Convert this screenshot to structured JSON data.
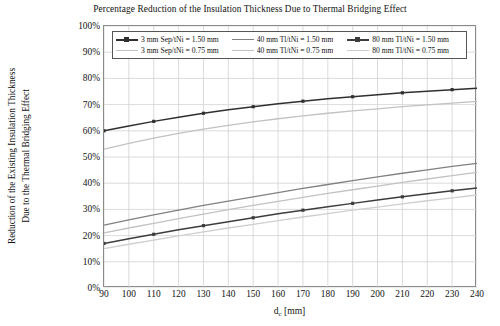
{
  "chart_data": {
    "type": "line",
    "title": "Percentage Reduction of the Insulation Thickness Due to Thermal Bridging Effect",
    "xlabel": "d_c [mm]",
    "xlabel_base": "d",
    "xlabel_sub": "c",
    "xlabel_unit": "[mm]",
    "ylabel_line1": "Reduction of the Existing Insulation Thickness",
    "ylabel_line2": "Due to the Thermal Bridging Effect",
    "xlim": [
      90,
      240
    ],
    "ylim": [
      0,
      100
    ],
    "grid": true,
    "legend_position": "top-inside",
    "x": [
      90,
      100,
      110,
      120,
      130,
      140,
      150,
      160,
      170,
      180,
      190,
      200,
      210,
      220,
      230,
      240
    ],
    "xticklabels": [
      "90",
      "100",
      "110",
      "120",
      "130",
      "140",
      "150",
      "160",
      "170",
      "180",
      "190",
      "200",
      "210",
      "220",
      "230",
      "240"
    ],
    "yticklabels": [
      "0%",
      "10%",
      "20%",
      "30%",
      "40%",
      "50%",
      "60%",
      "70%",
      "80%",
      "90%",
      "100%"
    ],
    "yticks": [
      0,
      10,
      20,
      30,
      40,
      50,
      60,
      70,
      80,
      90,
      100
    ],
    "series": [
      {
        "name": "3 mm Sep/tNi = 1.50 mm",
        "color": "#2f2f2f",
        "width": 1.5,
        "marker": "square",
        "values": [
          60.0,
          61.8,
          63.6,
          65.2,
          66.7,
          68.0,
          69.2,
          70.3,
          71.3,
          72.2,
          73.0,
          73.8,
          74.5,
          75.1,
          75.7,
          76.2
        ]
      },
      {
        "name": "3 mm Sep/tNi = 0.75 mm",
        "color": "#c2c2c2",
        "width": 1.3,
        "marker": "none",
        "values": [
          53.0,
          55.2,
          57.2,
          59.0,
          60.6,
          62.1,
          63.4,
          64.6,
          65.7,
          66.7,
          67.6,
          68.4,
          69.2,
          69.9,
          70.6,
          71.2
        ]
      },
      {
        "name": "40 mm Tl/tNi = 1.50 mm",
        "color": "#808080",
        "width": 1.3,
        "marker": "none",
        "values": [
          24.0,
          26.0,
          27.9,
          29.7,
          31.5,
          33.2,
          34.8,
          36.4,
          38.0,
          39.5,
          41.0,
          42.4,
          43.8,
          45.1,
          46.4,
          47.6
        ]
      },
      {
        "name": "40 mm Tl/tNi = 0.75 mm",
        "color": "#c2c2c2",
        "width": 1.3,
        "marker": "none",
        "values": [
          21.0,
          22.9,
          24.7,
          26.5,
          28.2,
          29.9,
          31.5,
          33.1,
          34.6,
          36.1,
          37.5,
          38.9,
          40.3,
          41.6,
          42.9,
          44.1
        ]
      },
      {
        "name": "80 mm Tl/tNi = 1.50 mm",
        "color": "#3d3d3d",
        "width": 1.5,
        "marker": "square",
        "values": [
          17.0,
          18.8,
          20.5,
          22.2,
          23.8,
          25.3,
          26.8,
          28.3,
          29.7,
          31.0,
          32.3,
          33.6,
          34.8,
          36.0,
          37.1,
          38.2
        ]
      },
      {
        "name": "80 mm Tl/tNi = 0.75 mm",
        "color": "#cfcfcf",
        "width": 1.3,
        "marker": "none",
        "values": [
          15.0,
          16.7,
          18.3,
          19.9,
          21.4,
          22.9,
          24.3,
          25.7,
          27.1,
          28.4,
          29.7,
          30.9,
          32.1,
          33.3,
          34.4,
          35.5
        ]
      }
    ],
    "legend": [
      [
        "3 mm Sep/tNi = 1.50 mm",
        "40 mm Tl/tNi = 1.50 mm",
        "80 mm Tl/tNi = 1.50 mm"
      ],
      [
        "3 mm Sep/tNi = 0.75 mm",
        "40 mm Tl/tNi = 0.75 mm",
        "80 mm Tl/tNi = 0.75 mm"
      ]
    ]
  },
  "colors": {
    "grid": "#d2d2d2",
    "frame": "#8a8a8a",
    "text": "#111111",
    "background": "#ffffff"
  }
}
